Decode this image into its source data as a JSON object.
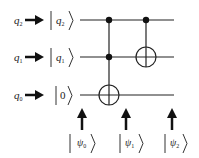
{
  "diagram": {
    "type": "quantum-circuit",
    "qubits": [
      {
        "name": "q",
        "sub": "2",
        "input_state": "q",
        "input_sub": "2"
      },
      {
        "name": "q",
        "sub": "1",
        "input_state": "q",
        "input_sub": "1"
      },
      {
        "name": "q",
        "sub": "0",
        "input_state": "0",
        "input_sub": ""
      }
    ],
    "gates": [
      {
        "type": "Toffoli",
        "controls": [
          "q2",
          "q1"
        ],
        "target": "q0"
      },
      {
        "type": "CNOT",
        "controls": [
          "q2"
        ],
        "target": "q1"
      }
    ],
    "states": [
      {
        "symbol": "ψ",
        "sub": "0"
      },
      {
        "symbol": "ψ",
        "sub": "1"
      },
      {
        "symbol": "ψ",
        "sub": "2"
      }
    ],
    "colors": {
      "line": "#222222",
      "background": "#ffffff"
    }
  }
}
